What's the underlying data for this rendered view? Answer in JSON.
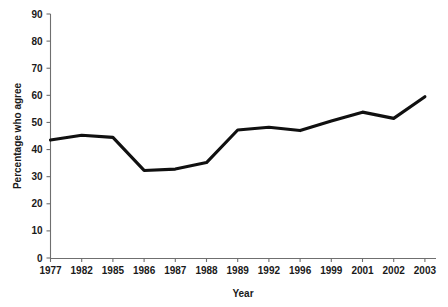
{
  "chart_data": {
    "type": "line",
    "title": "",
    "xlabel": "Year",
    "ylabel": "Percentage who agree",
    "categories": [
      "1977",
      "1982",
      "1985",
      "1986",
      "1987",
      "1988",
      "1989",
      "1992",
      "1996",
      "1999",
      "2001",
      "2002",
      "2003"
    ],
    "values": [
      43.5,
      45.3,
      44.5,
      32.3,
      32.8,
      35.2,
      47.2,
      48.2,
      47.0,
      50.5,
      53.8,
      51.5,
      59.5
    ],
    "series": [
      {
        "name": "Percentage who agree",
        "values": [
          43.5,
          45.3,
          44.5,
          32.3,
          32.8,
          35.2,
          47.2,
          48.2,
          47.0,
          50.5,
          53.8,
          51.5,
          59.5
        ],
        "color": "#101010"
      }
    ],
    "ylim": [
      0,
      90
    ],
    "ytick_values": [
      0,
      10,
      20,
      30,
      40,
      50,
      60,
      70,
      80,
      90
    ],
    "ytick_labels": [
      "0",
      "10",
      "20",
      "30",
      "40",
      "50",
      "60",
      "70",
      "80",
      "90"
    ],
    "xtick_labels": [
      "1977",
      "1982",
      "1985",
      "1986",
      "1987",
      "1988",
      "1989",
      "1992",
      "1996",
      "1999",
      "2001",
      "2002",
      "2003"
    ],
    "grid": false,
    "legend": false,
    "legend_position": "none",
    "background_color": "#ffffff",
    "axis_color": "#6f6f6f",
    "text_color": "#1a1a1a"
  }
}
